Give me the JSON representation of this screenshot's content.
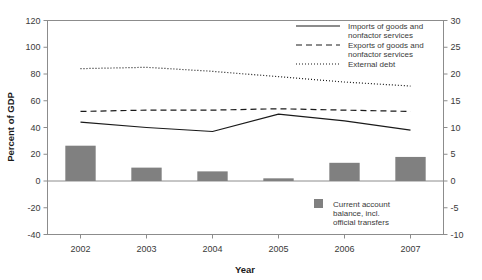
{
  "chart_data": {
    "type": "bar",
    "title": "",
    "subtitle": "",
    "xlabel": "Year",
    "ylabel": "Percent of GDP",
    "y2label": "",
    "categories": [
      "2002",
      "2003",
      "2004",
      "2005",
      "2006",
      "2007"
    ],
    "ylim": [
      -40,
      120
    ],
    "y2lim": [
      -10,
      30
    ],
    "yticks": [
      "120",
      "100",
      "80",
      "60",
      "40",
      "20",
      "0",
      "-20",
      "-40"
    ],
    "ytick_values": [
      120,
      100,
      80,
      60,
      40,
      20,
      0,
      -20,
      -40
    ],
    "y2ticks": [
      "30",
      "25",
      "20",
      "15",
      "10",
      "5",
      "0",
      "-5",
      "-10"
    ],
    "y2tick_values": [
      30,
      25,
      20,
      15,
      10,
      5,
      0,
      -5,
      -10
    ],
    "grid": false,
    "legend_position": "top-right",
    "bar_color": "#808080",
    "line_color": "#1a1a1a",
    "series": [
      {
        "name": "Current account balance, incl. official transfers",
        "type": "bar",
        "axis": "right",
        "color": "#808080",
        "values": [
          6.6,
          2.5,
          1.8,
          0.5,
          3.4,
          4.5
        ]
      },
      {
        "name": "Imports of goods and nonfactor services",
        "type": "line",
        "style": "solid",
        "axis": "left",
        "values": [
          44,
          40,
          37,
          50,
          45,
          38
        ]
      },
      {
        "name": "Exports of goods and nonfactor services",
        "type": "line",
        "style": "dashed",
        "axis": "left",
        "values": [
          52,
          53,
          53,
          54,
          53,
          52
        ]
      },
      {
        "name": "External debt",
        "type": "line",
        "style": "dotted",
        "axis": "left",
        "values": [
          84,
          85,
          82,
          78,
          74,
          71
        ]
      }
    ]
  },
  "legend": {
    "line_entries": [
      {
        "label_line1": "Imports of goods and",
        "label_line2": "nonfactor services",
        "style": "solid"
      },
      {
        "label_line1": "Exports of goods and",
        "label_line2": "nonfactor services",
        "style": "dashed"
      },
      {
        "label_line1": "External debt",
        "label_line2": "",
        "style": "dotted"
      }
    ],
    "bar_entry": {
      "label_line1": "Current account",
      "label_line2": "balance, incl.",
      "label_line3": "official transfers",
      "swatch_color": "#808080"
    }
  }
}
